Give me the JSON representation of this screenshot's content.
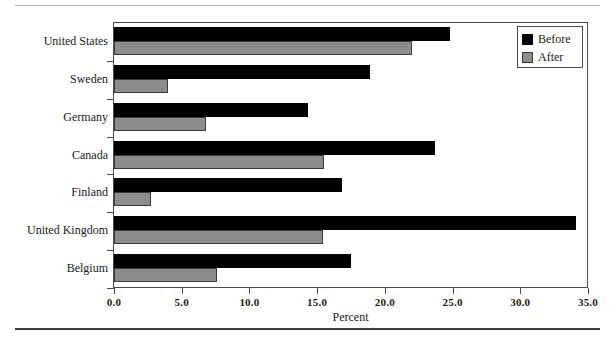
{
  "chart_data": {
    "type": "bar",
    "orientation": "horizontal",
    "title": "",
    "xlabel": "Percent",
    "ylabel": "",
    "xlim": [
      0.0,
      35.0
    ],
    "xticks": [
      "0.0",
      "5.0",
      "10.0",
      "15.0",
      "20.0",
      "25.0",
      "30.0",
      "35.0"
    ],
    "xtick_values": [
      0,
      5,
      10,
      15,
      20,
      25,
      30,
      35
    ],
    "grid": false,
    "legend_position": "top-right",
    "categories": [
      "United States",
      "Sweden",
      "Germany",
      "Canada",
      "Finland",
      "United Kingdom",
      "Belgium"
    ],
    "series": [
      {
        "name": "Before",
        "color": "#000000",
        "values": [
          24.8,
          18.9,
          14.3,
          23.7,
          16.8,
          34.1,
          17.5
        ]
      },
      {
        "name": "After",
        "color": "#8c8c8c",
        "values": [
          22.0,
          4.0,
          6.8,
          15.5,
          2.7,
          15.4,
          7.6
        ]
      }
    ]
  },
  "legend": {
    "items": [
      {
        "label": "Before",
        "swatch": "black-square-icon"
      },
      {
        "label": "After",
        "swatch": "gray-square-icon"
      }
    ]
  },
  "axis": {
    "x_title": "Percent"
  }
}
